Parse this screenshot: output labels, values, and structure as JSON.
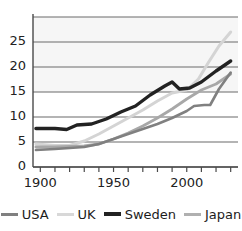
{
  "chart_data": {
    "type": "line",
    "title": "",
    "xlabel": "",
    "ylabel": "",
    "xlim": [
      1895,
      2035
    ],
    "ylim": [
      0,
      30
    ],
    "yticks": [
      0,
      5,
      10,
      15,
      20,
      25
    ],
    "ytick_labels": [
      "0",
      "5",
      "10",
      "15",
      "20",
      "25"
    ],
    "xticks": [
      1900,
      1950,
      2000
    ],
    "xtick_labels": [
      "1900",
      "1950",
      "2000"
    ],
    "x_minor_ticks": [
      1900,
      1910,
      1920,
      1930,
      1940,
      1950,
      1960,
      1970,
      1980,
      1990,
      2000,
      2010,
      2020,
      2030
    ],
    "grid": true,
    "legend_position": "bottom",
    "series": [
      {
        "name": "USA",
        "color": "#808080",
        "width": 2.6,
        "x": [
          1897,
          1910,
          1920,
          1930,
          1940,
          1950,
          1960,
          1970,
          1980,
          1990,
          2000,
          2005,
          2012,
          2016,
          2022,
          2030
        ],
        "values": [
          3.4,
          3.6,
          3.8,
          4.0,
          4.6,
          5.6,
          6.6,
          7.6,
          8.6,
          9.8,
          11.2,
          12.2,
          12.4,
          12.4,
          15.6,
          18.9
        ]
      },
      {
        "name": "UK",
        "color": "#d4d4d4",
        "width": 3.0,
        "x": [
          1897,
          1910,
          1920,
          1930,
          1940,
          1950,
          1960,
          1970,
          1980,
          1990,
          2000,
          2008,
          2015,
          2022,
          2030
        ],
        "values": [
          4.6,
          4.3,
          4.3,
          5.2,
          6.6,
          8.2,
          9.8,
          11.4,
          13.2,
          14.8,
          15.4,
          17.6,
          21.0,
          24.2,
          27.0
        ]
      },
      {
        "name": "Sweden",
        "color": "#222222",
        "width": 3.4,
        "x": [
          1897,
          1910,
          1918,
          1925,
          1935,
          1945,
          1955,
          1965,
          1975,
          1985,
          1990,
          1995,
          2002,
          2010,
          2020,
          2030
        ],
        "values": [
          7.7,
          7.7,
          7.5,
          8.4,
          8.6,
          9.6,
          11.0,
          12.2,
          14.4,
          16.2,
          17.0,
          15.6,
          15.8,
          17.0,
          19.2,
          21.2
        ]
      },
      {
        "name": "Japan",
        "color": "#a8a8a8",
        "width": 2.8,
        "x": [
          1897,
          1910,
          1920,
          1930,
          1940,
          1950,
          1960,
          1970,
          1980,
          1990,
          2000,
          2010,
          2020,
          2030
        ],
        "values": [
          4.0,
          4.0,
          4.1,
          4.2,
          4.6,
          5.6,
          6.8,
          8.2,
          9.8,
          11.6,
          13.6,
          15.4,
          16.6,
          18.6
        ]
      }
    ]
  },
  "legend": {
    "items": [
      {
        "label": "USA",
        "color": "#808080",
        "thick": false
      },
      {
        "label": "UK",
        "color": "#d8d8d8",
        "thick": false
      },
      {
        "label": "Sweden",
        "color": "#222222",
        "thick": true
      },
      {
        "label": "Japan",
        "color": "#b0b0b0",
        "thick": false
      }
    ]
  },
  "axis": {
    "line_color": "#4a4a4a",
    "grid_color": "#6b6b6b",
    "band_color": "#f0f0f0"
  }
}
